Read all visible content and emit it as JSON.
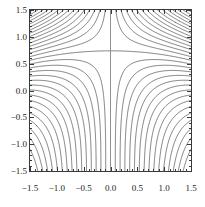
{
  "figure": {
    "type": "contour-plot",
    "background_color": "#ffffff",
    "frame_color": "#3a3a3a",
    "contour_color": "#303030"
  },
  "axes": {
    "x": {
      "min": -1.5,
      "max": 1.5,
      "tick_labels": [
        "-1.5",
        "-1.0",
        "-0.5",
        "0.0",
        "0.5",
        "1.0",
        "1.5"
      ],
      "tick_values": [
        -1.5,
        -1.0,
        -0.5,
        0.0,
        0.5,
        1.0,
        1.5
      ],
      "label": ""
    },
    "y": {
      "min": -1.5,
      "max": 1.5,
      "tick_labels": [
        "1.5",
        "1.0",
        "0.5",
        "0.0",
        "-0.5",
        "-1.0",
        "-1.5"
      ],
      "tick_values": [
        1.5,
        1.0,
        0.5,
        0.0,
        -0.5,
        -1.0,
        -1.5
      ],
      "label": ""
    }
  },
  "chart_data": {
    "type": "contour",
    "title": "",
    "xlabel": "",
    "ylabel": "",
    "xlim": [
      -1.5,
      1.5
    ],
    "ylim": [
      -1.5,
      1.5
    ],
    "grid": false,
    "legend": "none",
    "colormap": "grayscale-lines",
    "function": "sin(x)*cos(y) - x*y",
    "n_levels": 30,
    "level_min": -2.1,
    "level_max": 2.1,
    "level_step": 0.145,
    "extrema": [
      {
        "x": 0.85,
        "y": 0.55,
        "kind": "local-min",
        "closed_contour": true
      },
      {
        "x": -0.85,
        "y": -0.55,
        "kind": "local-max",
        "closed_contour": true
      }
    ],
    "saddles": [
      {
        "x": -0.45,
        "y": 1.3
      },
      {
        "x": 0.45,
        "y": -1.3
      }
    ],
    "dense_regions": [
      "upper-left-corner",
      "lower-right-corner"
    ],
    "annotations": []
  }
}
